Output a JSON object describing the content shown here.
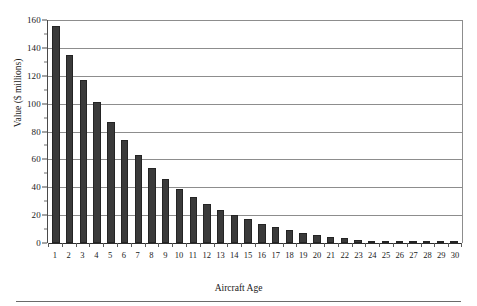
{
  "chart_data": {
    "type": "bar",
    "title": "",
    "xlabel": "Aircraft Age",
    "ylabel": "Value ($ millions)",
    "categories": [
      "1",
      "2",
      "3",
      "4",
      "5",
      "6",
      "7",
      "8",
      "9",
      "10",
      "11",
      "12",
      "13",
      "14",
      "15",
      "16",
      "17",
      "18",
      "19",
      "20",
      "21",
      "22",
      "23",
      "24",
      "25",
      "26",
      "27",
      "28",
      "29",
      "30"
    ],
    "values": [
      156,
      135,
      117,
      101,
      87,
      74,
      63,
      54,
      46,
      39,
      33,
      28,
      24,
      20,
      17,
      14,
      11.5,
      9.5,
      7.5,
      6,
      4.5,
      3.5,
      2.5,
      1.8,
      1.2,
      0.9,
      0.6,
      0.4,
      0.3,
      0.2
    ],
    "ylim": [
      0,
      160
    ],
    "ytick_step": 20,
    "ytick_labels": [
      "0",
      "20",
      "40",
      "60",
      "80",
      "100",
      "120",
      "140",
      "160"
    ],
    "xlim_categories": 30,
    "grid": "horizontal",
    "legend": "none",
    "bar_color": "#3a3a3a",
    "gridline_color": "#8d8d8d",
    "axis_color": "#2e2e2e",
    "background": "#ffffff"
  },
  "axes": {
    "y_title": "Value ($ millions)",
    "x_title": "Aircraft Age"
  }
}
